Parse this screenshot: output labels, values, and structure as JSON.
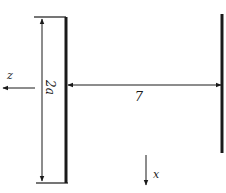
{
  "diagram": {
    "labels": {
      "z_axis": "z",
      "x_axis": "x",
      "aperture_width": "2a",
      "separation": "7"
    },
    "colors": {
      "ink": "#1a1a1a",
      "background": "#ffffff"
    }
  }
}
